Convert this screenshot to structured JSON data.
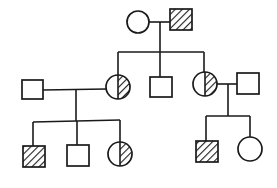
{
  "diagram": {
    "type": "pedigree",
    "colors": {
      "line": "#1a1a1a",
      "background": "#ffffff",
      "hatch": "#1a1a1a"
    },
    "legend_conventions": {
      "square": "male",
      "circle": "female",
      "hatched": "affected",
      "half_hatched": "carrier"
    },
    "generations": [
      {
        "id": "I",
        "individuals": [
          {
            "id": "I-1",
            "sex": "female",
            "status": "unaffected"
          },
          {
            "id": "I-2",
            "sex": "male",
            "status": "affected"
          }
        ]
      },
      {
        "id": "II",
        "individuals": [
          {
            "id": "II-1",
            "sex": "male",
            "status": "unaffected",
            "note": "spouse"
          },
          {
            "id": "II-2",
            "sex": "female",
            "status": "carrier"
          },
          {
            "id": "II-3",
            "sex": "male",
            "status": "unaffected"
          },
          {
            "id": "II-4",
            "sex": "female",
            "status": "carrier"
          },
          {
            "id": "II-5",
            "sex": "male",
            "status": "unaffected",
            "note": "spouse"
          }
        ]
      },
      {
        "id": "III",
        "individuals": [
          {
            "id": "III-1",
            "sex": "male",
            "status": "affected"
          },
          {
            "id": "III-2",
            "sex": "male",
            "status": "unaffected"
          },
          {
            "id": "III-3",
            "sex": "female",
            "status": "carrier"
          },
          {
            "id": "III-4",
            "sex": "male",
            "status": "affected"
          },
          {
            "id": "III-5",
            "sex": "female",
            "status": "unaffected"
          }
        ]
      }
    ],
    "matings": [
      {
        "parents": [
          "I-1",
          "I-2"
        ],
        "children": [
          "II-2",
          "II-3",
          "II-4"
        ]
      },
      {
        "parents": [
          "II-1",
          "II-2"
        ],
        "children": [
          "III-1",
          "III-2",
          "III-3"
        ]
      },
      {
        "parents": [
          "II-4",
          "II-5"
        ],
        "children": [
          "III-4",
          "III-5"
        ]
      }
    ]
  }
}
